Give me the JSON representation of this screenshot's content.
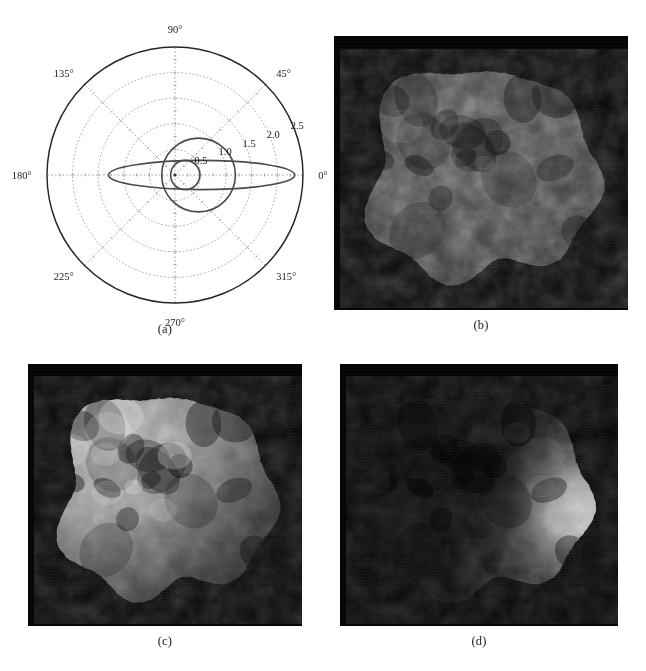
{
  "figure": {
    "layout": "2x2 grid of subfigures",
    "background_color": "#ffffff",
    "caption_color": "#1c1c1c"
  },
  "panels": [
    {
      "id": "a",
      "caption": "(a)",
      "kind": "polar-plot"
    },
    {
      "id": "b",
      "caption": "(b)",
      "kind": "grayscale-render"
    },
    {
      "id": "c",
      "caption": "(c)",
      "kind": "grayscale-render"
    },
    {
      "id": "d",
      "caption": "(d)",
      "kind": "grayscale-render"
    }
  ],
  "chart_data": {
    "type": "line",
    "projection": "polar",
    "title": "",
    "xlabel": "",
    "ylabel": "",
    "grid": true,
    "grid_style": "dotted",
    "grid_color": "#9b9b9b",
    "legend": "none",
    "theta_unit": "degrees",
    "theta_direction": "counterclockwise",
    "theta_zero_location": "E",
    "angular_ticks": [
      "0°",
      "45°",
      "90°",
      "135°",
      "180°",
      "225°",
      "270°",
      "315°"
    ],
    "angular_tick_values": [
      0,
      45,
      90,
      135,
      180,
      225,
      270,
      315
    ],
    "radial_ticks": [
      "0.5",
      "1.0",
      "1.5",
      "2.0",
      "2.5"
    ],
    "radial_tick_values": [
      0.5,
      1.0,
      1.5,
      2.0,
      2.5
    ],
    "rlim": [
      0,
      2.5
    ],
    "radial_label_angle_deg": 20,
    "outer_boundary_color": "#262626",
    "curve_color": "#4a4a4a",
    "series": [
      {
        "name": "flat-ellipse",
        "shape": "ellipse",
        "semi_major": 1.82,
        "semi_minor": 0.285,
        "center_r": 0.52,
        "center_theta_deg": 0,
        "orientation_deg": 0
      },
      {
        "name": "large-circle",
        "shape": "circle",
        "radius": 0.72,
        "center_r": 0.46,
        "center_theta_deg": 0
      },
      {
        "name": "small-circle",
        "shape": "circle",
        "radius": 0.285,
        "center_r": 0.2,
        "center_theta_deg": 0
      }
    ],
    "origin_marker": "dot"
  },
  "renders": {
    "b": {
      "body_name": "irregular-nucleus",
      "background_color": "#050505",
      "illumination": "near-uniform dim frontal lighting",
      "light_direction": "front",
      "brightness_level": "low-medium",
      "terminator_visible": false
    },
    "c": {
      "body_name": "irregular-nucleus",
      "background_color": "#050505",
      "illumination": "strong lighting from upper-left",
      "light_direction": "upper-left",
      "brightness_level": "high",
      "terminator_visible": true
    },
    "d": {
      "body_name": "irregular-nucleus",
      "background_color": "#050505",
      "illumination": "back-lit, bright crescent on right limb",
      "light_direction": "right",
      "brightness_level": "very-low with bright limb",
      "terminator_visible": true
    }
  }
}
